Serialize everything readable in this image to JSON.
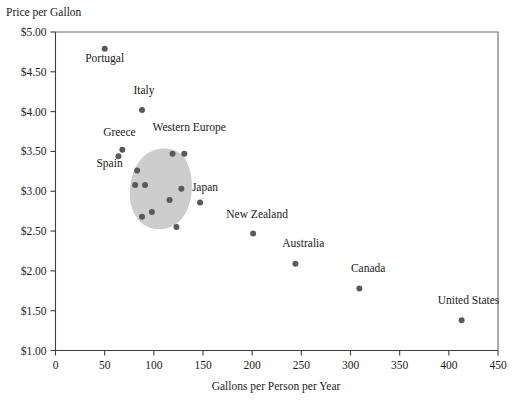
{
  "chart_data": {
    "type": "scatter",
    "title": "",
    "ylabel": "Price per Gallon",
    "xlabel": "Gallons per Person per Year",
    "xlim": [
      0,
      450
    ],
    "ylim": [
      1.0,
      5.0
    ],
    "grid": false,
    "legend": "none",
    "xticks": [
      "0",
      "50",
      "100",
      "150",
      "200",
      "250",
      "300",
      "350",
      "400",
      "450"
    ],
    "xtick_values": [
      0,
      50,
      100,
      150,
      200,
      250,
      300,
      350,
      400,
      450
    ],
    "yticks": [
      "$1.00",
      "$1.50",
      "$2.00",
      "$2.50",
      "$3.00",
      "$3.50",
      "$4.00",
      "$4.50",
      "$5.00"
    ],
    "ytick_values": [
      1.0,
      1.5,
      2.0,
      2.5,
      3.0,
      3.5,
      4.0,
      4.5,
      5.0
    ],
    "point_color": "#59595f",
    "region_color": "#c9c9c9",
    "points": [
      {
        "label": "Portugal",
        "x": 50,
        "y": 4.79
      },
      {
        "label": "Italy",
        "x": 88,
        "y": 4.02
      },
      {
        "label": "Greece",
        "x": 68,
        "y": 3.52
      },
      {
        "label": "Spain",
        "x": 64,
        "y": 3.44
      },
      {
        "label": "",
        "x": 83,
        "y": 3.26
      },
      {
        "label": "",
        "x": 81,
        "y": 3.08
      },
      {
        "label": "",
        "x": 91,
        "y": 3.08
      },
      {
        "label": "",
        "x": 119,
        "y": 3.47
      },
      {
        "label": "",
        "x": 131,
        "y": 3.47
      },
      {
        "label": "",
        "x": 128,
        "y": 3.03
      },
      {
        "label": "",
        "x": 116,
        "y": 2.89
      },
      {
        "label": "",
        "x": 98,
        "y": 2.74
      },
      {
        "label": "",
        "x": 88,
        "y": 2.68
      },
      {
        "label": "",
        "x": 123,
        "y": 2.55
      },
      {
        "label": "Japan",
        "x": 147,
        "y": 2.86
      },
      {
        "label": "New Zealand",
        "x": 201,
        "y": 2.47
      },
      {
        "label": "Australia",
        "x": 244,
        "y": 2.09
      },
      {
        "label": "Canada",
        "x": 309,
        "y": 1.78
      },
      {
        "label": "United States",
        "x": 413,
        "y": 1.38
      }
    ],
    "annotations": [
      {
        "text": "Western Europe",
        "x": 136,
        "y": 3.76
      },
      {
        "text": "Portugal",
        "x": 50,
        "y": 4.62
      },
      {
        "text": "Italy",
        "x": 90,
        "y": 4.22
      },
      {
        "text": "Greece",
        "x": 65,
        "y": 3.7
      },
      {
        "text": "Spain",
        "x": 55,
        "y": 3.3
      },
      {
        "text": "Japan",
        "x": 152,
        "y": 3.0
      },
      {
        "text": "New Zealand",
        "x": 205,
        "y": 2.67
      },
      {
        "text": "Australia",
        "x": 252,
        "y": 2.3
      },
      {
        "text": "Canada",
        "x": 318,
        "y": 1.98
      },
      {
        "text": "United States",
        "x": 420,
        "y": 1.58
      }
    ],
    "region": {
      "name": "Western Europe cluster",
      "shape": "blob"
    }
  }
}
